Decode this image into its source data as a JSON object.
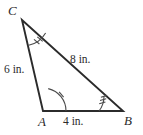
{
  "figure": {
    "type": "triangle-diagram",
    "background_color": "#ffffff",
    "stroke_color": "#2b2b2b",
    "vertices": {
      "C": {
        "label": "C",
        "x": 22,
        "y": 20
      },
      "A": {
        "label": "A",
        "x": 43,
        "y": 111
      },
      "B": {
        "label": "B",
        "x": 123,
        "y": 111
      }
    },
    "sides": [
      {
        "name": "CA",
        "label": "6 in.",
        "value": 6,
        "unit": "in.",
        "from": "C",
        "to": "A"
      },
      {
        "name": "CB",
        "label": "8 in.",
        "value": 8,
        "unit": "in.",
        "from": "C",
        "to": "B"
      },
      {
        "name": "AB",
        "label": "4 in.",
        "value": 4,
        "unit": "in.",
        "from": "A",
        "to": "B"
      }
    ],
    "angle_marks": [
      {
        "vertex": "C",
        "ticks": 2,
        "arc_radius": 26
      },
      {
        "vertex": "A",
        "ticks": 1,
        "arc_radius": 23
      },
      {
        "vertex": "B",
        "ticks": 3,
        "arc_radius": 24
      }
    ]
  }
}
